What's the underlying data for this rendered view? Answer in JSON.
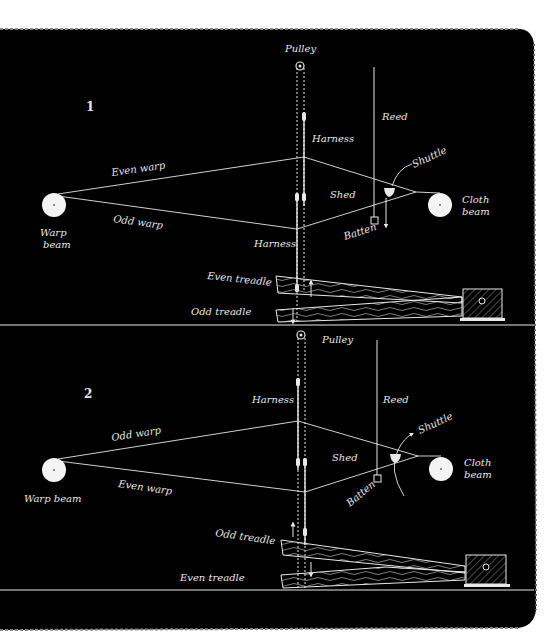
{
  "colors": {
    "background": "#000000",
    "ink": "#e8e8e8",
    "paper": "#ffffff"
  },
  "panels": [
    {
      "number": "1",
      "labels": {
        "pulley": "Pulley",
        "reed": "Reed",
        "harness_top": "Harness",
        "harness_bottom": "Harness",
        "upper_warp": "Even warp",
        "lower_warp": "Odd warp",
        "shed": "Shed",
        "shuttle": "Shuttle",
        "batten": "Batten",
        "warp_beam_line1": "Warp",
        "warp_beam_line2": "beam",
        "cloth_beam_line1": "Cloth",
        "cloth_beam_line2": "beam",
        "upper_treadle": "Even treadle",
        "lower_treadle": "Odd treadle"
      }
    },
    {
      "number": "2",
      "labels": {
        "pulley": "Pulley",
        "reed": "Reed",
        "harness_top": "Harness",
        "upper_warp": "Odd warp",
        "lower_warp": "Even warp",
        "shed": "Shed",
        "shuttle": "Shuttle",
        "batten": "Batten",
        "warp_beam": "Warp beam",
        "cloth_beam_line1": "Cloth",
        "cloth_beam_line2": "beam",
        "upper_treadle": "Odd treadle",
        "lower_treadle": "Even treadle"
      }
    }
  ]
}
